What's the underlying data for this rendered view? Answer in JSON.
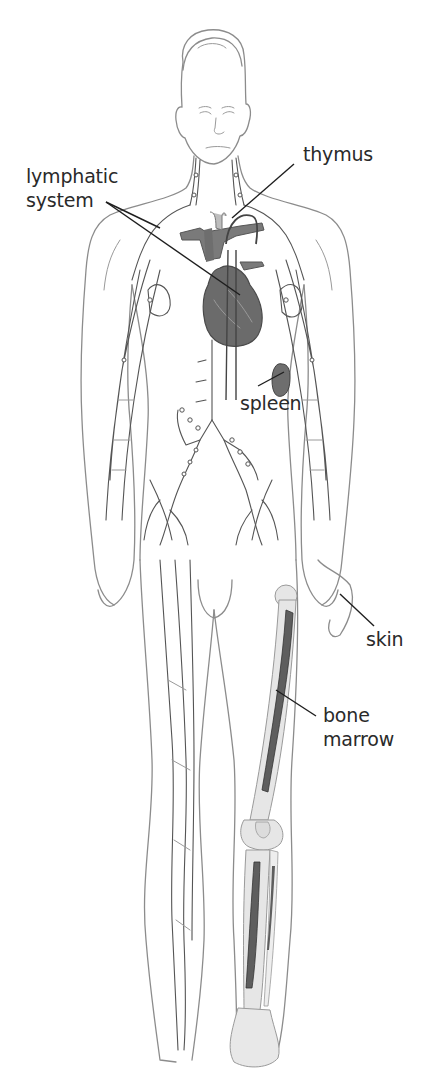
{
  "figure": {
    "background": "#ffffff",
    "colors": {
      "outline": "#8c8c8c",
      "lymph_vessels": "#555555",
      "organ_fill": "#6b6b6b",
      "bone_fill": "#e6e6e6",
      "marrow_fill": "#5e5e5e",
      "label_text": "#2a2a2a"
    }
  },
  "labels": {
    "lymphatic_line1": "lymphatic",
    "lymphatic_line2": "system",
    "thymus": "thymus",
    "spleen": "spleen",
    "skin": "skin",
    "bone_line1": "bone",
    "bone_line2": "marrow"
  },
  "structures": [
    {
      "name": "lymphatic system",
      "icon": "lymph-vessel-network"
    },
    {
      "name": "thymus",
      "icon": "thymus-gland"
    },
    {
      "name": "heart and great vessels",
      "icon": "heart"
    },
    {
      "name": "spleen",
      "icon": "spleen"
    },
    {
      "name": "skin",
      "icon": "body-outline"
    },
    {
      "name": "bone marrow",
      "icon": "femur-tibia-marrow"
    }
  ]
}
